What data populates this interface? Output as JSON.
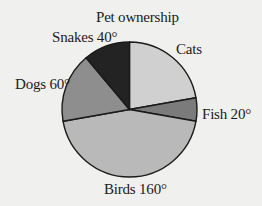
{
  "chart_data": {
    "type": "pie",
    "title": "Pet ownership",
    "units": "degrees",
    "start_angle_deg": 0,
    "direction": "clockwise",
    "slices": [
      {
        "label": "Cats",
        "value": 80,
        "label_text": "Cats",
        "color": "#d0d0d0"
      },
      {
        "label": "Fish",
        "value": 20,
        "label_text": "Fish 20°",
        "color": "#7b7b7b"
      },
      {
        "label": "Birds",
        "value": 160,
        "label_text": "Birds 160°",
        "color": "#b9b9b9"
      },
      {
        "label": "Dogs",
        "value": 60,
        "label_text": "Dogs 60°",
        "color": "#8e8e8e"
      },
      {
        "label": "Snakes",
        "value": 40,
        "label_text": "Snakes 40°",
        "color": "#232323"
      }
    ],
    "categories": [
      "Cats",
      "Fish",
      "Birds",
      "Dogs",
      "Snakes"
    ],
    "values": [
      80,
      20,
      160,
      60,
      40
    ],
    "legend": "none (labels placed beside slices)"
  },
  "geometry": {
    "cx": 129.5,
    "cy": 109.5,
    "r": 67.5,
    "stroke": "#1a1a1a"
  }
}
